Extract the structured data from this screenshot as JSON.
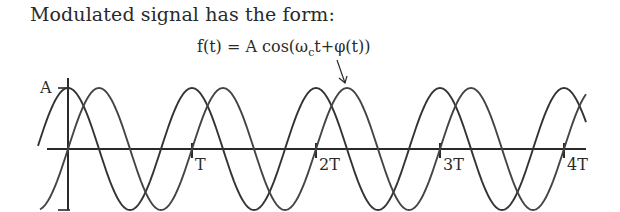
{
  "heading": "Modulated signal has the form:",
  "formula": {
    "lhs": "f(t) = A cos(ω",
    "sub": "c",
    "rhs": "t+φ(t))"
  },
  "axis": {
    "amplitude_label": "A",
    "tick_labels": [
      "T",
      "2T",
      "3T",
      "4T"
    ]
  },
  "colors": {
    "ink": "#2a2a2a",
    "background": "#ffffff"
  },
  "chart_data": {
    "type": "line",
    "title": "f(t) = A cos(ωct+φ(t))",
    "xlabel": "t",
    "ylabel": "",
    "x_ticks": [
      "T",
      "2T",
      "3T",
      "4T"
    ],
    "y_ticks": [
      "A"
    ],
    "series": [
      {
        "name": "carrier A cos(ωct)",
        "description": "unmodulated cosine, peak at t=0, period T"
      },
      {
        "name": "modulated A cos(ωct+φ(t))",
        "description": "phase-shifted copy (~quarter period lag)"
      }
    ],
    "periods_shown": 4,
    "annotation": "arrow from formula to modulated curve near t≈2.25T"
  }
}
